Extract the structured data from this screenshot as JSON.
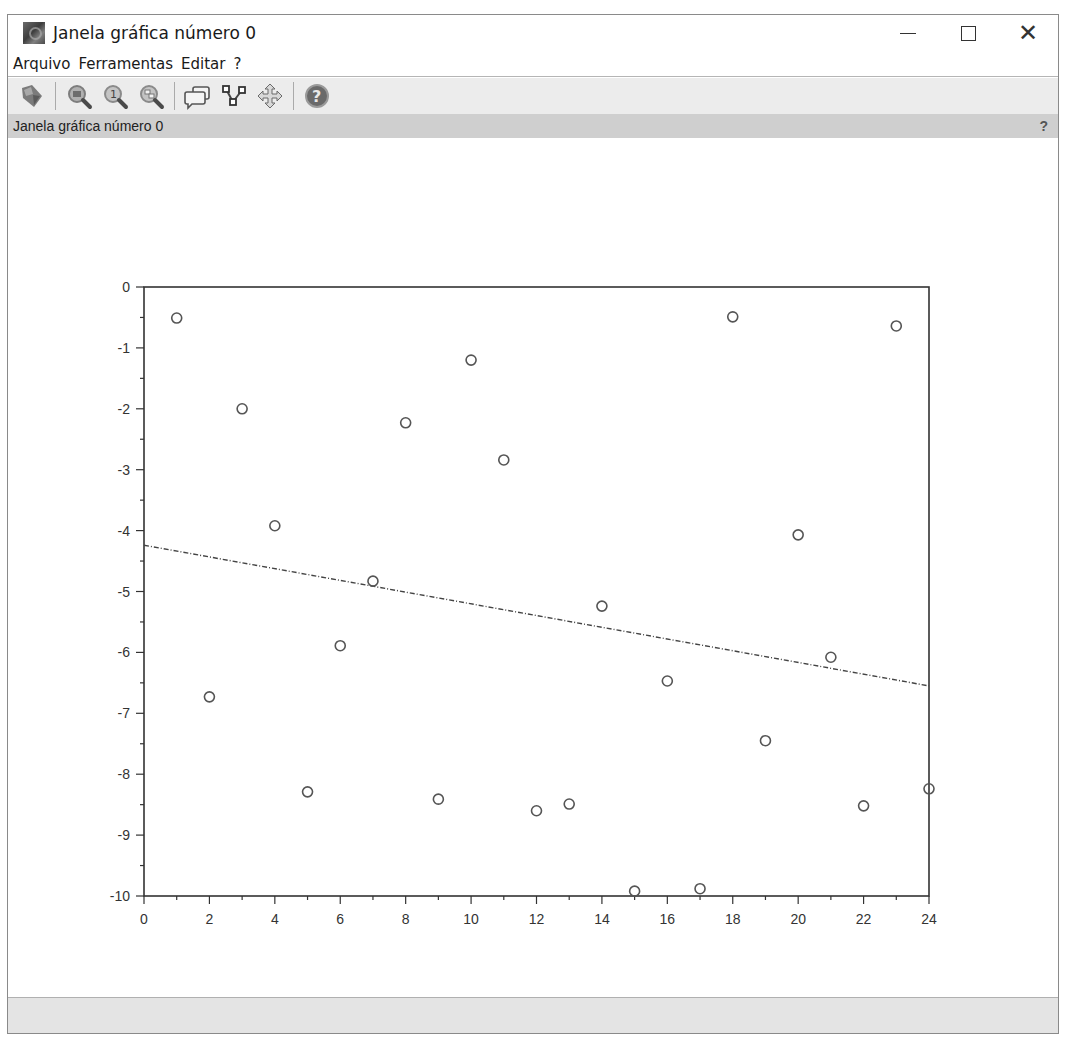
{
  "window": {
    "title": "Janela gráfica número 0",
    "controls": {
      "minimize": "minimize",
      "maximize": "maximize",
      "close": "close"
    }
  },
  "menu": [
    {
      "label": "Arquivo"
    },
    {
      "label": "Ferramentas"
    },
    {
      "label": "Editar"
    },
    {
      "label": "?"
    }
  ],
  "toolbar": {
    "buttons": [
      {
        "icon": "rotate-icon",
        "tooltip": "Rotação 2D/3D"
      },
      {
        "icon": "zoom-in-icon",
        "tooltip": "Zoom"
      },
      {
        "icon": "zoom-reset-icon",
        "tooltip": "Zoom original"
      },
      {
        "icon": "zoom-area-icon",
        "tooltip": "Zoom área"
      },
      {
        "icon": "datatips-icon",
        "tooltip": "Dicas de dados"
      },
      {
        "icon": "edit-curve-icon",
        "tooltip": "Editar curva"
      },
      {
        "icon": "pan-icon",
        "tooltip": "Mover"
      },
      {
        "icon": "help-icon",
        "tooltip": "Ajuda"
      }
    ]
  },
  "subbar": {
    "title": "Janela gráfica número 0",
    "help": "?"
  },
  "colors": {
    "axis": "#333333",
    "marker": "#555555",
    "trend": "#444444",
    "subbar_bg": "#cfcfcf",
    "toolbar_bg": "#ececec",
    "statusbar_bg": "#e4e4e4"
  },
  "chart_data": {
    "type": "scatter",
    "title": "",
    "xlabel": "",
    "ylabel": "",
    "xlim": [
      0,
      24
    ],
    "ylim": [
      -10,
      0
    ],
    "grid": false,
    "legend": "none",
    "x_ticks": [
      0,
      2,
      4,
      6,
      8,
      10,
      12,
      14,
      16,
      18,
      20,
      22,
      24
    ],
    "x_tick_labels": [
      "0",
      "2",
      "4",
      "6",
      "8",
      "10",
      "12",
      "14",
      "16",
      "18",
      "20",
      "22",
      "24"
    ],
    "y_ticks": [
      0,
      -1,
      -2,
      -3,
      -4,
      -5,
      -6,
      -7,
      -8,
      -9,
      -10
    ],
    "y_tick_labels": [
      "0",
      "-1",
      "-2",
      "-3",
      "-4",
      "-5",
      "-6",
      "-7",
      "-8",
      "-9",
      "-10"
    ],
    "series": [
      {
        "name": "data",
        "style": "circle-markers",
        "x": [
          1,
          2,
          3,
          4,
          5,
          6,
          7,
          8,
          9,
          10,
          11,
          12,
          13,
          14,
          15,
          16,
          17,
          18,
          19,
          20,
          21,
          22,
          23,
          24
        ],
        "y": [
          -0.51,
          -6.73,
          -2.0,
          -3.92,
          -8.29,
          -5.89,
          -4.83,
          -2.23,
          -8.41,
          -1.2,
          -2.84,
          -8.6,
          -8.49,
          -5.24,
          -9.92,
          -6.47,
          -9.88,
          -0.49,
          -7.45,
          -4.07,
          -6.08,
          -8.52,
          -0.64,
          -8.24
        ]
      },
      {
        "name": "linear fit",
        "style": "dash-dot-line",
        "x": [
          0,
          24
        ],
        "y": [
          -4.24,
          -6.55
        ]
      }
    ]
  }
}
